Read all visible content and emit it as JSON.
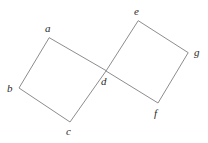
{
  "figure": {
    "type": "geometry-diagram",
    "canvas": {
      "width": 208,
      "height": 143,
      "background": "#ffffff"
    },
    "style": {
      "stroke_color": "#8d8d8d",
      "stroke_width": 1,
      "label_color": "#2b2b2b",
      "label_font_size": 11,
      "label_style": "italic"
    },
    "points": {
      "a": {
        "x": 49,
        "y": 38,
        "label": "a",
        "label_x": 45,
        "label_y": 23
      },
      "b": {
        "x": 19,
        "y": 88,
        "label": "b",
        "label_x": 7,
        "label_y": 83
      },
      "c": {
        "x": 70,
        "y": 122,
        "label": "c",
        "label_x": 66,
        "label_y": 126
      },
      "d": {
        "x": 106,
        "y": 71,
        "label": "d",
        "label_x": 101,
        "label_y": 76
      },
      "e": {
        "x": 138,
        "y": 21,
        "label": "e",
        "label_x": 134,
        "label_y": 6
      },
      "f": {
        "x": 158,
        "y": 103,
        "label": "f",
        "label_x": 154,
        "label_y": 108
      },
      "g": {
        "x": 188,
        "y": 53,
        "label": "g",
        "label_x": 194,
        "label_y": 47
      }
    },
    "shapes": [
      {
        "name": "left-square",
        "vertices": [
          "a",
          "b",
          "c",
          "d"
        ],
        "path": "M 49 38 L 19 88 L 70 122 L 106 71 Z"
      },
      {
        "name": "right-square",
        "vertices": [
          "e",
          "d",
          "f",
          "g"
        ],
        "path": "M 138 21 L 106 71 L 158 103 L 188 53 Z"
      }
    ],
    "labels": [
      "a",
      "b",
      "c",
      "d",
      "e",
      "f",
      "g"
    ]
  }
}
